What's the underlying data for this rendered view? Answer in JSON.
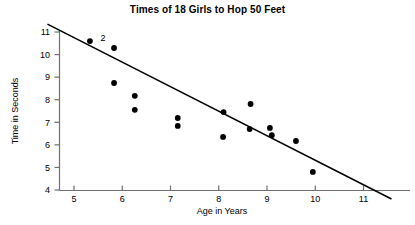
{
  "chart_data": {
    "type": "scatter",
    "title": "Times of 18 Girls to Hop 50 Feet",
    "xlabel": "Age in Years",
    "ylabel": "Time in Seconds",
    "xlim": [
      4.4,
      11.6
    ],
    "ylim": [
      4,
      11.35
    ],
    "xticks": [
      "5",
      "6",
      "7",
      "8",
      "9",
      "10",
      "11"
    ],
    "xtick_values": [
      5,
      6,
      7,
      8,
      9,
      10,
      11
    ],
    "yticks": [
      "4",
      "5",
      "6",
      "7",
      "8",
      "9",
      "10",
      "11"
    ],
    "ytick_values": [
      4,
      5,
      6,
      7,
      8,
      9,
      10,
      11
    ],
    "grid": false,
    "legend": null,
    "marker_color": "#000000",
    "line_color": "#000000",
    "axis_color": "#6f6f6f",
    "points": [
      {
        "x": 5.33,
        "y": 10.6,
        "label": "2"
      },
      {
        "x": 5.83,
        "y": 10.29,
        "label": ""
      },
      {
        "x": 5.83,
        "y": 8.74,
        "label": ""
      },
      {
        "x": 6.26,
        "y": 8.17,
        "label": ""
      },
      {
        "x": 6.26,
        "y": 7.55,
        "label": ""
      },
      {
        "x": 7.15,
        "y": 7.19,
        "label": ""
      },
      {
        "x": 7.15,
        "y": 6.84,
        "label": ""
      },
      {
        "x": 8.09,
        "y": 6.35,
        "label": ""
      },
      {
        "x": 8.1,
        "y": 7.45,
        "label": ""
      },
      {
        "x": 8.66,
        "y": 7.81,
        "label": ""
      },
      {
        "x": 8.64,
        "y": 6.7,
        "label": ""
      },
      {
        "x": 9.06,
        "y": 6.75,
        "label": ""
      },
      {
        "x": 9.1,
        "y": 6.43,
        "label": ""
      },
      {
        "x": 9.6,
        "y": 6.17,
        "label": ""
      },
      {
        "x": 9.95,
        "y": 4.8,
        "label": ""
      }
    ],
    "trend_line": {
      "x1": 4.45,
      "y1": 11.35,
      "x2": 11.58,
      "y2": 3.6,
      "description": "fitted line of best fit"
    },
    "annotations": [
      {
        "text": "2",
        "x": 5.55,
        "y": 10.75,
        "note": "indicates two coincident observations"
      }
    ]
  }
}
